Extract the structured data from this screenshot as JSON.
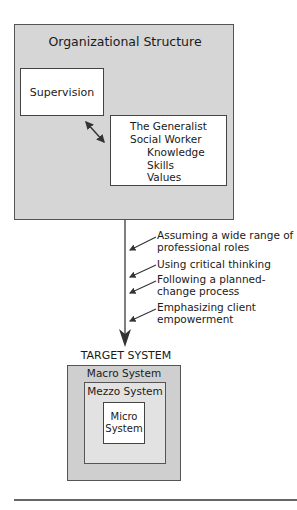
{
  "organizational_structure": {
    "title": "Organizational Structure",
    "supervision": "Supervision",
    "generalist": {
      "title_line1": "The Generalist",
      "title_line2": "Social Worker",
      "attributes": [
        "Knowledge",
        "Skills",
        "Values"
      ]
    }
  },
  "process_roles": [
    {
      "line1": "Assuming a wide range of",
      "line2": "professional roles"
    },
    {
      "line1": "Using critical thinking",
      "line2": ""
    },
    {
      "line1": "Following a planned-",
      "line2": "change process"
    },
    {
      "line1": "Emphasizing client",
      "line2": "empowerment"
    }
  ],
  "target_system": {
    "label": "TARGET SYSTEM",
    "macro": "Macro System",
    "mezzo": "Mezzo System",
    "micro_line1": "Micro",
    "micro_line2": "System"
  },
  "colors": {
    "outer_fill": "#d6d6d6",
    "macro_fill": "#cfcfcf",
    "mezzo_fill": "#e2e2e2",
    "box_fill": "#ffffff",
    "stroke": "#444444"
  }
}
